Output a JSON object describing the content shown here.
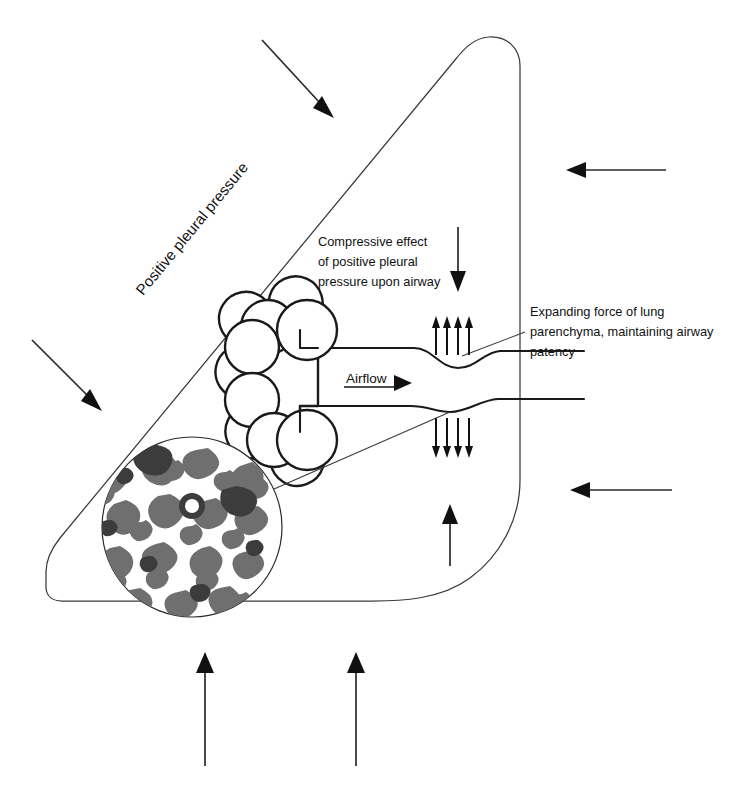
{
  "figure": {
    "background_color": "#ffffff",
    "ink_color": "#111111",
    "outline_color": "#3a3a3a"
  },
  "labels": {
    "pleural_pressure": "Positive pleural pressure",
    "compressive_effect": [
      "Compressive effect",
      "of positive pleural",
      "pressure upon airway"
    ],
    "expanding_force": [
      "Expanding force of lung",
      "parenchyma, maintaining airway",
      "patency"
    ],
    "airflow": "Airflow"
  },
  "icons": {
    "compression_arrow": "down-arrow-icon",
    "airflow_arrow": "right-arrow-icon",
    "expansion_ticks_upper": "up-arrow-cluster-icon",
    "expansion_ticks_lower": "down-arrow-cluster-icon",
    "external_pressure_arrows": "inward-pressure-arrow-icon"
  },
  "counts": {
    "upper_airway_ticks": 4,
    "lower_airway_ticks": 4,
    "external_arrows": 6,
    "alveolar_sacs": 6
  },
  "external_arrows": [
    {
      "name": "top-left-diagonal-arrow",
      "direction": "down-right"
    },
    {
      "name": "right-upper-arrow",
      "direction": "left"
    },
    {
      "name": "left-middle-diagonal-arrow",
      "direction": "down-right"
    },
    {
      "name": "right-lower-arrow",
      "direction": "left"
    },
    {
      "name": "bottom-left-arrow",
      "direction": "up"
    },
    {
      "name": "bottom-right-arrow",
      "direction": "up"
    },
    {
      "name": "interior-upward-arrow",
      "direction": "up"
    }
  ],
  "histology": {
    "name": "lung-parenchyma-micrograph",
    "description": "Alveolar parenchyma histology inset"
  }
}
